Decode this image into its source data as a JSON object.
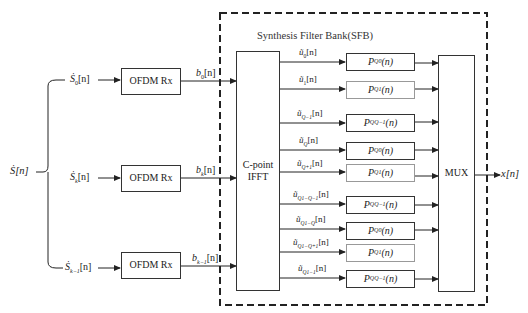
{
  "diagram": {
    "title": "Synthesis Filter Bank(SFB)",
    "input": "Ṡ[n]",
    "output": "x[n]",
    "branches": [
      {
        "input": "Ṡ₀[n]",
        "block": "OFDM Rx",
        "output": "b₀[n]"
      },
      {
        "input": "Ṡₖ[n]",
        "block": "OFDM Rx",
        "output": "bₖ[n]"
      },
      {
        "input": "Ṡₖ₋₁[n]",
        "block": "OFDM Rx",
        "output": "bₖ₋₁[n]"
      }
    ],
    "ifft_block": {
      "line1": "C-point",
      "line2": "IFFT"
    },
    "mux_block": "MUX",
    "sub_signals": [
      {
        "signal": "ũ₀[n]",
        "filter": "P_Q0(n)"
      },
      {
        "signal": "ũ₁[n]",
        "filter": "P_Q1(n)"
      },
      {
        "signal": "ũ_{Q−1}[n]",
        "filter": "P_{QQ−1}(n)"
      },
      {
        "signal": "ũ_Q[n]",
        "filter": "P_Q0(n)"
      },
      {
        "signal": "ũ_{Q+1}[n]",
        "filter": "P_Q1(n)"
      },
      {
        "signal": "ũ_{2Q−1}[n]",
        "filter": "P_{QQ−1}(n)"
      },
      {
        "signal": "ũ_{Q1−Q}[n]",
        "filter": "P_Q0(n)"
      },
      {
        "signal": "ũ_{Q1−Q+1}[n]",
        "filter": "P_Q1(n)"
      },
      {
        "signal": "ũ_{Q1−1}[n]",
        "filter": "P_{QQ−1}(n)"
      }
    ]
  },
  "labels": {
    "title": "Synthesis Filter Bank(SFB)",
    "input_main": "Ṡ[n]",
    "output_main": "x[n]",
    "ofdm": "OFDM Rx",
    "ifft_1": "C-point",
    "ifft_2": "IFFT",
    "mux": "MUX",
    "s0_base": "Ṡ",
    "s0_sub": "0",
    "s0_tail": "[n]",
    "sk_base": "Ṡ",
    "sk_sub": "k",
    "sk_tail": "[n]",
    "sk1_base": "Ṡ",
    "sk1_sub": "k−1",
    "sk1_tail": "[n]",
    "b0_base": "b",
    "b0_sub": "0",
    "b0_tail": "[n]",
    "bk_base": "b",
    "bk_sub": "k",
    "bk_tail": "[n]",
    "bk1_base": "b",
    "bk1_sub": "k−1",
    "bk1_tail": "[n]",
    "u": [
      {
        "base": "ũ",
        "sub": "0",
        "tail": "[n]"
      },
      {
        "base": "ũ",
        "sub": "1",
        "tail": "[n]"
      },
      {
        "base": "ũ",
        "sub": "Q−1",
        "tail": "[n]"
      },
      {
        "base": "ũ",
        "sub": "Q",
        "tail": "[n]"
      },
      {
        "base": "ũ",
        "sub": "Q+1",
        "tail": "[n]"
      },
      {
        "base": "ũ",
        "sub": "Q1−Q−1",
        "tail": "[n]"
      },
      {
        "base": "ũ",
        "sub": "Q1−Q",
        "tail": "[n]"
      },
      {
        "base": "ũ",
        "sub": "Q1−Q+1",
        "tail": "[n]"
      },
      {
        "base": "ũ",
        "sub": "Q1−1",
        "tail": "[n]"
      }
    ],
    "p": [
      {
        "base": "P",
        "sub": "Q0",
        "tail": "(n)"
      },
      {
        "base": "P",
        "sub": "Q1",
        "tail": "(n)"
      },
      {
        "base": "P",
        "sub": "QQ−1",
        "tail": "(n)"
      },
      {
        "base": "P",
        "sub": "Q0",
        "tail": "(n)"
      },
      {
        "base": "P",
        "sub": "Q1",
        "tail": "(n)"
      },
      {
        "base": "P",
        "sub": "QQ−1",
        "tail": "(n)"
      },
      {
        "base": "P",
        "sub": "Q0",
        "tail": "(n)"
      },
      {
        "base": "P",
        "sub": "Q1",
        "tail": "(n)"
      },
      {
        "base": "P",
        "sub": "QQ−1",
        "tail": "(n)"
      }
    ]
  }
}
